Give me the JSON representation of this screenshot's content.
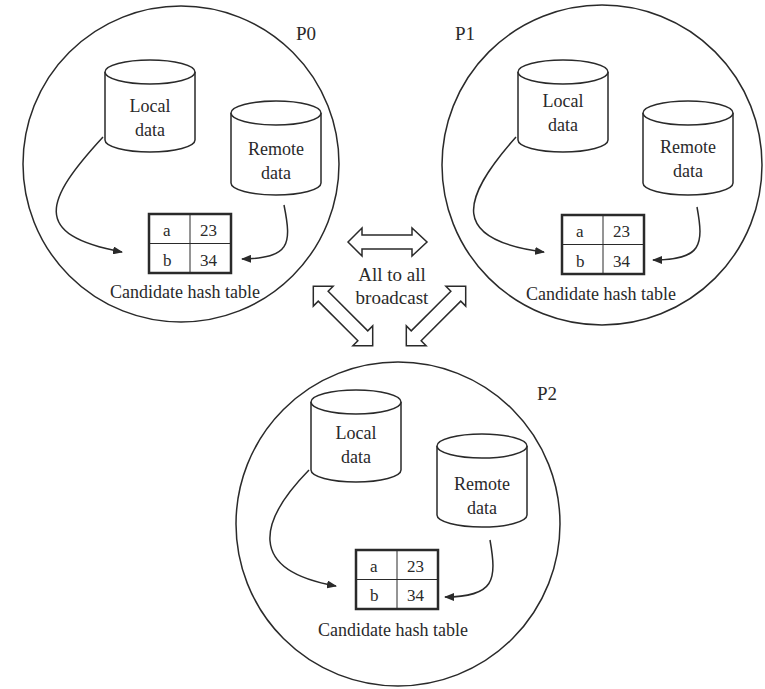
{
  "diagram": {
    "center_label": {
      "line1": "All to all",
      "line2": "broadcast"
    },
    "processors": [
      {
        "id": "P0",
        "label": "P0",
        "local": {
          "line1": "Local",
          "line2": "data"
        },
        "remote": {
          "line1": "Remote",
          "line2": "data"
        },
        "table": {
          "rows": [
            [
              "a",
              "23"
            ],
            [
              "b",
              "34"
            ]
          ],
          "caption": "Candidate hash table"
        }
      },
      {
        "id": "P1",
        "label": "P1",
        "local": {
          "line1": "Local",
          "line2": "data"
        },
        "remote": {
          "line1": "Remote",
          "line2": "data"
        },
        "table": {
          "rows": [
            [
              "a",
              "23"
            ],
            [
              "b",
              "34"
            ]
          ],
          "caption": "Candidate hash table"
        }
      },
      {
        "id": "P2",
        "label": "P2",
        "local": {
          "line1": "Local",
          "line2": "data"
        },
        "remote": {
          "line1": "Remote",
          "line2": "data"
        },
        "table": {
          "rows": [
            [
              "a",
              "23"
            ],
            [
              "b",
              "34"
            ]
          ],
          "caption": "Candidate hash table"
        }
      }
    ],
    "colors": {
      "stroke": "#2a2a2a",
      "background": "#ffffff"
    }
  }
}
